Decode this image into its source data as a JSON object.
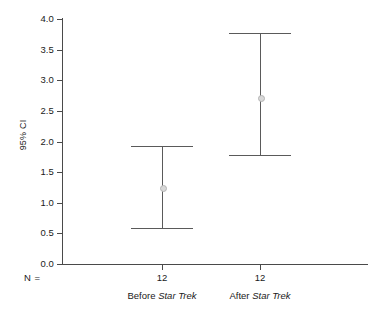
{
  "chart_data": {
    "type": "scatter",
    "title": "",
    "subtitle": "",
    "xlabel": "",
    "ylabel": "95% CI",
    "ylim": [
      0.0,
      4.0
    ],
    "ytick_labels": [
      "0.0",
      "0.5",
      "1.0",
      "1.5",
      "2.0",
      "2.5",
      "3.0",
      "3.5",
      "4.0"
    ],
    "ytick_values": [
      0.0,
      0.5,
      1.0,
      1.5,
      2.0,
      2.5,
      3.0,
      3.5,
      4.0
    ],
    "grid": false,
    "legend": "none",
    "n_row_label": "N =",
    "categories": [
      "Before Star Trek",
      "After Star Trek"
    ],
    "category_labels": [
      {
        "prefix": "Before ",
        "italic": "Star Trek"
      },
      {
        "prefix": "After ",
        "italic": "Star Trek"
      }
    ],
    "n_values": [
      "12",
      "12"
    ],
    "series": [
      {
        "name": "95% CI",
        "points": [
          {
            "category": "Before Star Trek",
            "mean": 1.25,
            "ci_lower": 0.58,
            "ci_upper": 1.93
          },
          {
            "category": "After Star Trek",
            "mean": 2.73,
            "ci_lower": 1.78,
            "ci_upper": 3.77
          }
        ]
      }
    ],
    "colors": {
      "axis": "#4a4a4a",
      "errorbar": "#5a5a5a",
      "marker_fill": "#d8d8d8",
      "marker_edge": "#b4b4b4",
      "text": "#1a1a1a",
      "background": "#ffffff"
    }
  }
}
